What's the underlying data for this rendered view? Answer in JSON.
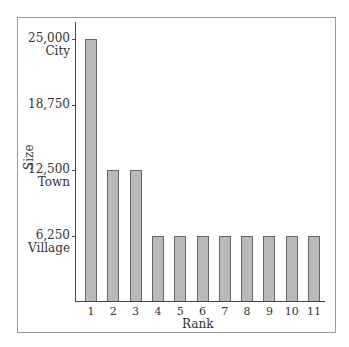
{
  "chart_data": {
    "type": "bar",
    "title": "",
    "xlabel": "Rank",
    "ylabel": "Size",
    "categories": [
      "1",
      "2",
      "3",
      "4",
      "5",
      "6",
      "7",
      "8",
      "9",
      "10",
      "11"
    ],
    "values": [
      25000,
      12500,
      12500,
      6250,
      6250,
      6250,
      6250,
      6250,
      6250,
      6250,
      6250
    ],
    "ylim": [
      0,
      25000
    ],
    "yticks": [
      {
        "value": 25000,
        "label": "25,000",
        "sublabel": "City"
      },
      {
        "value": 18750,
        "label": "18,750",
        "sublabel": ""
      },
      {
        "value": 12500,
        "label": "12,500",
        "sublabel": "Town"
      },
      {
        "value": 6250,
        "label": "6,250",
        "sublabel": "Village"
      }
    ],
    "grid": false,
    "legend": null,
    "bar_color": "#b9b9b9",
    "bar_edge_color": "#666666"
  }
}
